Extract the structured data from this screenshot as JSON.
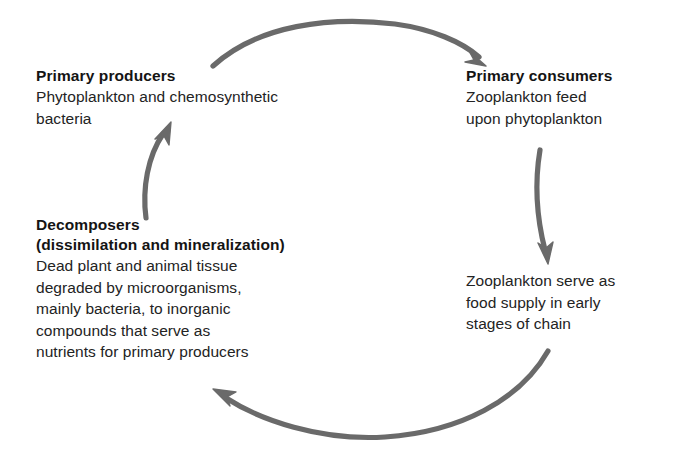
{
  "diagram": {
    "arrow_color": "#6a6a6a",
    "text_color": "#1a1a1a",
    "background_color": "#ffffff",
    "nodes": [
      {
        "id": "primary-producers",
        "title": "Primary producers",
        "subtitle": "",
        "body_lines": [
          "Phytoplankton and chemosynthetic",
          "bacteria"
        ]
      },
      {
        "id": "primary-consumers",
        "title": "Primary consumers",
        "subtitle": "",
        "body_lines": [
          "Zooplankton feed",
          "upon phytoplankton"
        ]
      },
      {
        "id": "zooplankton-supply",
        "title": "",
        "subtitle": "",
        "body_lines": [
          "Zooplankton serve as",
          "food supply in early",
          "stages of chain"
        ]
      },
      {
        "id": "decomposers",
        "title": "Decomposers",
        "subtitle": "(dissimilation and mineralization)",
        "body_lines": [
          "Dead plant and animal tissue",
          "degraded by microorganisms,",
          "mainly bacteria, to inorganic",
          "compounds that serve as",
          "nutrients for primary producers"
        ]
      }
    ],
    "arrows": [
      {
        "id": "arrow-top",
        "from": "primary-producers",
        "to": "primary-consumers",
        "direction": "clockwise-top"
      },
      {
        "id": "arrow-right",
        "from": "primary-consumers",
        "to": "zooplankton-supply",
        "direction": "clockwise-right"
      },
      {
        "id": "arrow-bottom",
        "from": "zooplankton-supply",
        "to": "decomposers",
        "direction": "clockwise-bottom"
      },
      {
        "id": "arrow-left",
        "from": "decomposers",
        "to": "primary-producers",
        "direction": "clockwise-left"
      }
    ]
  }
}
